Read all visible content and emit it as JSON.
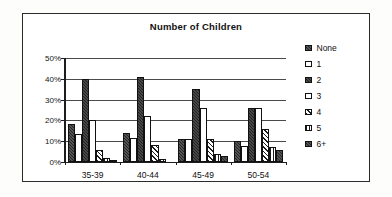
{
  "chart_data": {
    "type": "bar",
    "title": "Number of Children",
    "xlabel": "",
    "ylabel": "",
    "ylim": [
      0,
      50
    ],
    "ytick_labels": [
      "0%",
      "10%",
      "20%",
      "30%",
      "40%",
      "50%"
    ],
    "ytick_values": [
      0,
      10,
      20,
      30,
      40,
      50
    ],
    "grid": true,
    "legend_position": "right",
    "categories": [
      "35-39",
      "40-44",
      "45-49",
      "50-54"
    ],
    "series": [
      {
        "name": "None",
        "pattern": "dark-speckled",
        "values": [
          18.5,
          14,
          11,
          10
        ]
      },
      {
        "name": "1",
        "pattern": "white",
        "values": [
          13.5,
          11.5,
          11,
          7.5
        ]
      },
      {
        "name": "2",
        "pattern": "dark-speckled",
        "values": [
          40,
          41,
          35,
          26
        ]
      },
      {
        "name": "3",
        "pattern": "white",
        "values": [
          20,
          22,
          26,
          26
        ]
      },
      {
        "name": "4",
        "pattern": "diagonal-hatch",
        "values": [
          6,
          8,
          11,
          16
        ]
      },
      {
        "name": "5",
        "pattern": "vertical-stripe",
        "values": [
          2,
          1.5,
          4,
          7
        ]
      },
      {
        "name": "6+",
        "pattern": "dark-speckled",
        "values": [
          0.5,
          0,
          3,
          6
        ]
      }
    ]
  },
  "colors": {
    "axis": "#1d1d1d",
    "grid": "#4a4a4a",
    "frame": "#2b2b2b",
    "text": "#101010",
    "plot_background": "#ffffff",
    "page_background": "#fdfdfb"
  }
}
